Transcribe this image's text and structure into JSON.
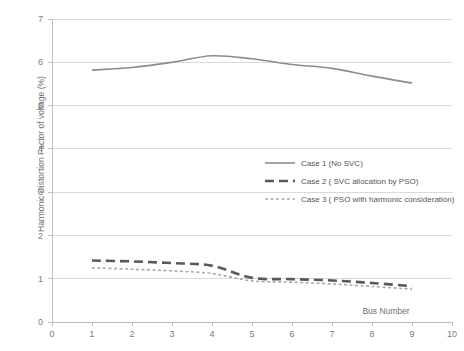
{
  "chart_data": {
    "type": "line",
    "title": "",
    "xlabel": "Bus Number",
    "ylabel": "Harmonic Distortion Factor of voltage (%)",
    "xlim": [
      0,
      10
    ],
    "ylim": [
      0,
      7
    ],
    "xticks": [
      "0",
      "1",
      "2",
      "3",
      "4",
      "5",
      "6",
      "7",
      "8",
      "9",
      "10"
    ],
    "yticks": [
      "0",
      "1",
      "2",
      "3",
      "4",
      "5",
      "6",
      "7"
    ],
    "grid": "horizontal",
    "legend_position": "center-right",
    "x": [
      1,
      2,
      3,
      4,
      5,
      6,
      7,
      8,
      9
    ],
    "series": [
      {
        "name": "Case 1 (No SVC)",
        "style": "solid",
        "color": "#8c8c8c",
        "width": 1.6,
        "values": [
          5.82,
          5.88,
          6.0,
          6.15,
          6.08,
          5.95,
          5.86,
          5.68,
          5.52
        ]
      },
      {
        "name": "Case 2 ( SVC allocation by PSO)",
        "style": "dashed",
        "color": "#595959",
        "width": 2.6,
        "values": [
          1.42,
          1.4,
          1.36,
          1.3,
          1.02,
          0.99,
          0.96,
          0.9,
          0.83
        ]
      },
      {
        "name": "Case 3 ( PSO with harmonic consideration)",
        "style": "dotted",
        "color": "#a8a8a8",
        "width": 1.6,
        "values": [
          1.25,
          1.22,
          1.18,
          1.12,
          0.95,
          0.92,
          0.88,
          0.82,
          0.76
        ]
      }
    ]
  },
  "colors": {
    "grid": "#d9d9d9",
    "axis": "#bfbfbf",
    "tick_text": "#7b7b7b",
    "legend_text": "#555555",
    "background": "#ffffff"
  }
}
